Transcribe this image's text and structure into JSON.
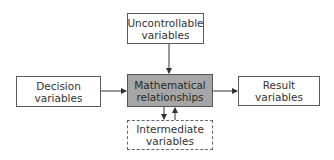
{
  "diagram": {
    "nodes": {
      "uncontrollable": {
        "label": "Uncontrollable\nvariables"
      },
      "decision": {
        "label": "Decision\nvariables"
      },
      "math": {
        "label": "Mathematical\nrelationships",
        "fill": "#a6a6a6"
      },
      "intermediate": {
        "label": "Intermediate\nvariables",
        "border": "dashed"
      },
      "result": {
        "label": "Result\nvariables"
      }
    },
    "edges": [
      {
        "from": "uncontrollable",
        "to": "math"
      },
      {
        "from": "decision",
        "to": "math"
      },
      {
        "from": "math",
        "to": "result"
      },
      {
        "from": "math",
        "to": "intermediate"
      },
      {
        "from": "intermediate",
        "to": "math"
      }
    ]
  }
}
